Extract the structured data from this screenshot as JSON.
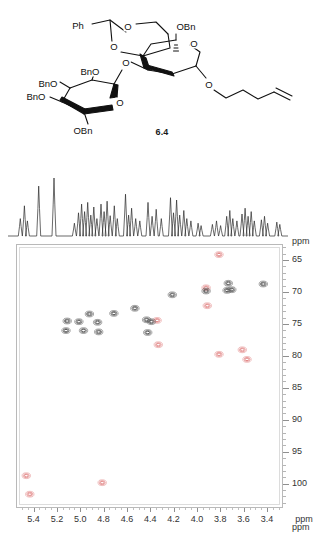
{
  "figure": {
    "compound_label": "6.4",
    "structure": {
      "name": "protected-trisaccharide-pentenyl-glycoside",
      "atom_labels": [
        {
          "text": "Ph",
          "x": 78,
          "y": 26
        },
        {
          "text": "O",
          "x": 128,
          "y": 27
        },
        {
          "text": "O",
          "x": 114,
          "y": 47
        },
        {
          "text": "OBn",
          "x": 186,
          "y": 27
        },
        {
          "text": "O",
          "x": 194,
          "y": 44
        },
        {
          "text": "O",
          "x": 126,
          "y": 63
        },
        {
          "text": "BnO",
          "x": 90,
          "y": 72
        },
        {
          "text": "BnO",
          "x": 48,
          "y": 84
        },
        {
          "text": "BnO",
          "x": 36,
          "y": 97
        },
        {
          "text": "O",
          "x": 120,
          "y": 103
        },
        {
          "text": "OBn",
          "x": 83,
          "y": 131
        },
        {
          "text": "O",
          "x": 209,
          "y": 85
        }
      ]
    }
  },
  "chart_data": {
    "type": "scatter",
    "xlabel": "ppm",
    "ylabel": "ppm",
    "xlim": [
      5.55,
      3.28
    ],
    "ylim": [
      103.5,
      62.5
    ],
    "x_ticks": [
      5.4,
      5.2,
      5.0,
      4.8,
      4.6,
      4.4,
      4.2,
      4.0,
      3.8,
      3.6,
      3.4
    ],
    "y_ticks": [
      65,
      70,
      75,
      80,
      85,
      90,
      95,
      100
    ],
    "grid": false,
    "legend": [
      {
        "name": "CH / CH3 (positive phase)",
        "color": "#e08080"
      },
      {
        "name": "CH2 (negative phase)",
        "color": "#555555"
      }
    ],
    "series": [
      {
        "name": "CH / CH3 (positive phase)",
        "color": "#e08080",
        "points": [
          {
            "x": 3.82,
            "y": 64.0
          },
          {
            "x": 3.93,
            "y": 69.2
          },
          {
            "x": 3.92,
            "y": 72.0
          },
          {
            "x": 4.35,
            "y": 74.3
          },
          {
            "x": 4.34,
            "y": 78.1
          },
          {
            "x": 3.82,
            "y": 79.6
          },
          {
            "x": 3.62,
            "y": 78.9
          },
          {
            "x": 3.58,
            "y": 80.4
          },
          {
            "x": 5.47,
            "y": 98.6
          },
          {
            "x": 4.82,
            "y": 99.7
          },
          {
            "x": 5.44,
            "y": 101.5
          }
        ]
      },
      {
        "name": "CH2 (negative phase)",
        "color": "#555555",
        "points": [
          {
            "x": 3.74,
            "y": 68.5
          },
          {
            "x": 3.44,
            "y": 68.6
          },
          {
            "x": 3.71,
            "y": 69.5
          },
          {
            "x": 3.75,
            "y": 69.6
          },
          {
            "x": 3.93,
            "y": 69.7
          },
          {
            "x": 4.22,
            "y": 70.3
          },
          {
            "x": 4.54,
            "y": 72.4
          },
          {
            "x": 4.72,
            "y": 73.2
          },
          {
            "x": 4.93,
            "y": 73.3
          },
          {
            "x": 4.44,
            "y": 74.2
          },
          {
            "x": 4.4,
            "y": 74.5
          },
          {
            "x": 5.12,
            "y": 74.4
          },
          {
            "x": 5.02,
            "y": 74.5
          },
          {
            "x": 4.86,
            "y": 74.6
          },
          {
            "x": 5.13,
            "y": 75.9
          },
          {
            "x": 4.98,
            "y": 75.9
          },
          {
            "x": 4.85,
            "y": 76.1
          },
          {
            "x": 4.43,
            "y": 76.2
          }
        ]
      }
    ],
    "proton_projection": {
      "description": "1D 1H projection trace displayed above the 2D contour plot",
      "peaks": [
        {
          "x": 5.5,
          "h": 0.3
        },
        {
          "x": 5.46,
          "h": 0.52
        },
        {
          "x": 5.43,
          "h": 0.26
        },
        {
          "x": 5.32,
          "h": 0.86
        },
        {
          "x": 5.17,
          "h": 1.0
        },
        {
          "x": 4.97,
          "h": 0.22
        },
        {
          "x": 4.93,
          "h": 0.4
        },
        {
          "x": 4.9,
          "h": 0.55
        },
        {
          "x": 4.87,
          "h": 0.42
        },
        {
          "x": 4.84,
          "h": 0.58
        },
        {
          "x": 4.81,
          "h": 0.36
        },
        {
          "x": 4.78,
          "h": 0.5
        },
        {
          "x": 4.75,
          "h": 0.3
        },
        {
          "x": 4.71,
          "h": 0.55
        },
        {
          "x": 4.68,
          "h": 0.42
        },
        {
          "x": 4.65,
          "h": 0.6
        },
        {
          "x": 4.62,
          "h": 0.35
        },
        {
          "x": 4.58,
          "h": 0.52
        },
        {
          "x": 4.55,
          "h": 0.3
        },
        {
          "x": 4.47,
          "h": 0.72
        },
        {
          "x": 4.44,
          "h": 0.36
        },
        {
          "x": 4.41,
          "h": 0.48
        },
        {
          "x": 4.37,
          "h": 0.3
        },
        {
          "x": 4.33,
          "h": 0.26
        },
        {
          "x": 4.25,
          "h": 0.58
        },
        {
          "x": 4.21,
          "h": 0.34
        },
        {
          "x": 4.17,
          "h": 0.46
        },
        {
          "x": 4.12,
          "h": 0.3
        },
        {
          "x": 4.03,
          "h": 0.66
        },
        {
          "x": 4.0,
          "h": 0.4
        },
        {
          "x": 3.97,
          "h": 0.62
        },
        {
          "x": 3.94,
          "h": 0.36
        },
        {
          "x": 3.9,
          "h": 0.44
        },
        {
          "x": 3.87,
          "h": 0.3
        },
        {
          "x": 3.83,
          "h": 0.26
        },
        {
          "x": 3.76,
          "h": 0.22
        },
        {
          "x": 3.73,
          "h": 0.18
        },
        {
          "x": 3.62,
          "h": 0.2
        },
        {
          "x": 3.58,
          "h": 0.26
        },
        {
          "x": 3.54,
          "h": 0.18
        },
        {
          "x": 3.48,
          "h": 0.34
        },
        {
          "x": 3.45,
          "h": 0.44
        },
        {
          "x": 3.42,
          "h": 0.3
        },
        {
          "x": 3.38,
          "h": 0.26
        },
        {
          "x": 3.33,
          "h": 0.38
        },
        {
          "x": 3.3,
          "h": 0.48
        },
        {
          "x": 3.27,
          "h": 0.34
        },
        {
          "x": 3.24,
          "h": 0.42
        },
        {
          "x": 3.21,
          "h": 0.26
        },
        {
          "x": 3.14,
          "h": 0.28
        },
        {
          "x": 3.11,
          "h": 0.34
        },
        {
          "x": 3.08,
          "h": 0.22
        },
        {
          "x": 2.99,
          "h": 0.24
        },
        {
          "x": 2.96,
          "h": 0.2
        }
      ]
    }
  },
  "axes": {
    "y_unit_top": "ppm",
    "y_unit_bottom": "ppm",
    "x_unit": "ppm"
  }
}
